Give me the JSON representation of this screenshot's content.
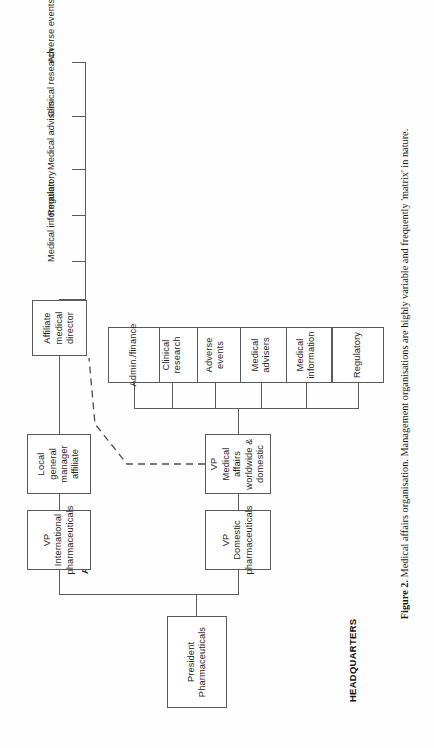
{
  "figure": {
    "number_label": "Figure 2.",
    "caption": "Medical affairs organisation. Management organisations are highly variable and frequently 'matrix' in nature.",
    "orientation": "rotated-90-ccw"
  },
  "sections": {
    "headquarters": "HEADQUARTERS",
    "affiliate": "AFFILIATE"
  },
  "nodes": {
    "president": "President\nPharmaceuticals",
    "president_l1": "President",
    "president_l2": "Pharmaceuticals",
    "vp_international": "VP\nInternational\npharmaceuticals",
    "vp_international_l1": "VP",
    "vp_international_l2": "International",
    "vp_international_l3": "pharmaceuticals",
    "vp_domestic": "VP\nDomestic\npharmaceuticals",
    "vp_domestic_l1": "VP",
    "vp_domestic_l2": "Domestic",
    "vp_domestic_l3": "pharmaceuticals",
    "vp_medical_affairs": "VP\nMedical affairs\nworldwide & domestic",
    "vp_medical_affairs_l1": "VP",
    "vp_medical_affairs_l2": "Medical affairs",
    "vp_medical_affairs_l3": "worldwide & domestic",
    "local_gm": "Local\ngeneral manager\naffiliate",
    "local_gm_l1": "Local",
    "local_gm_l2": "general manager",
    "local_gm_l3": "affiliate",
    "affiliate_medical_director": "Affiliate\nmedical\ndirector",
    "affiliate_medical_director_l1": "Affiliate",
    "affiliate_medical_director_l2": "medical",
    "affiliate_medical_director_l3": "director"
  },
  "hq_functions": [
    {
      "id": "regulatory",
      "label": "Regulatory",
      "line1": "Regulatory",
      "line2": ""
    },
    {
      "id": "medical-information",
      "label": "Medical information",
      "line1": "Medical",
      "line2": "information"
    },
    {
      "id": "medical-advisers",
      "label": "Medical advisers",
      "line1": "Medical",
      "line2": "advisers"
    },
    {
      "id": "adverse-events",
      "label": "Adverse events",
      "line1": "Adverse",
      "line2": "events"
    },
    {
      "id": "clinical-research",
      "label": "Clinical research",
      "line1": "Clinical",
      "line2": "research"
    },
    {
      "id": "admin-finance",
      "label": "Admin./finance",
      "line1": "Admin./finance",
      "line2": ""
    }
  ],
  "affiliate_functions": [
    {
      "id": "medical-information",
      "label": "Medical information"
    },
    {
      "id": "regulatory",
      "label": "Regulatory"
    },
    {
      "id": "medical-advisers",
      "label": "Medical advisers"
    },
    {
      "id": "clinical-research",
      "label": "Clinical research"
    },
    {
      "id": "adverse-events",
      "label": "Adverse events"
    }
  ],
  "relations": {
    "dotted_link_note": "dashed line between VP Medical affairs worldwide & domestic and Affiliate medical director"
  },
  "colors": {
    "page_background": "#ffffff",
    "box_border": "#5a5a5a",
    "text": "#1e1e1e",
    "line": "#5a5a5a"
  }
}
